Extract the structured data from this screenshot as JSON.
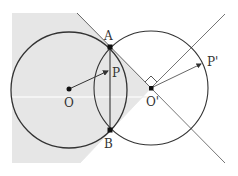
{
  "diagram": {
    "type": "geometry",
    "points": {
      "O": {
        "label": "O",
        "x": 69,
        "y": 89
      },
      "O_prime": {
        "label": "O'",
        "x": 151,
        "y": 88
      },
      "A": {
        "label": "A",
        "x": 110,
        "y": 47
      },
      "B": {
        "label": "B",
        "x": 110,
        "y": 130
      },
      "P": {
        "label": "P",
        "x": 112,
        "y": 70
      },
      "P_prime": {
        "label": "P'",
        "x": 200,
        "y": 62
      }
    },
    "circles": [
      {
        "name": "circle-O",
        "center": "O",
        "radius": 58
      },
      {
        "name": "circle-O-prime",
        "center": "O_prime",
        "radius": 57
      }
    ],
    "segments": [
      "AB",
      "OP (arrow)",
      "O'P' (arrow)"
    ],
    "rays": [
      "from O' up-right",
      "from O' down-right"
    ],
    "annotations": [
      "right-angle mark at O'"
    ],
    "shaded_region": "half-plane region left of the angle lines through O'",
    "colors": {
      "shade": "#e6e6e6",
      "stroke": "#333333",
      "thin_line": "#666666",
      "point": "#111111"
    }
  }
}
